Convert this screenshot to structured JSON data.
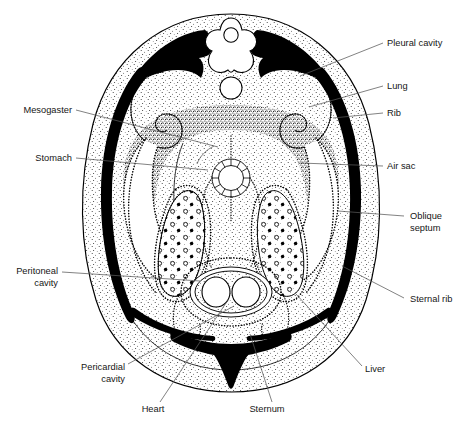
{
  "figure": {
    "view": "cross-section",
    "orientation": "dorsal at top, ventral at bottom"
  },
  "labels": {
    "left": [
      {
        "id": "mesogaster",
        "text": "Mesogaster",
        "x": 72,
        "y": 113,
        "lines": 1,
        "leader": [
          [
            76,
            110
          ],
          [
            218,
            147
          ]
        ]
      },
      {
        "id": "stomach",
        "text": "Stomach",
        "x": 72,
        "y": 161,
        "lines": 1,
        "leader": [
          [
            76,
            158
          ],
          [
            206,
            168
          ]
        ]
      },
      {
        "id": "peritoneal-cavity",
        "text": "Peritoneal\ncavity",
        "line1": "Peritoneal",
        "line2": "cavity",
        "x": 58,
        "y": 274,
        "lines": 2,
        "leader": [
          [
            62,
            272
          ],
          [
            196,
            281
          ]
        ]
      },
      {
        "id": "pericardial-cavity",
        "text": "Pericardial\ncavity",
        "line1": "Pericardial",
        "line2": "cavity",
        "x": 125,
        "y": 370,
        "lines": 2,
        "leader": [
          [
            128,
            364
          ],
          [
            231,
            317
          ]
        ]
      }
    ],
    "right": [
      {
        "id": "pleural-cavity",
        "text": "Pleural cavity",
        "x": 387,
        "y": 43,
        "lines": 1,
        "leader": [
          [
            383,
            43
          ],
          [
            300,
            75
          ]
        ]
      },
      {
        "id": "lung",
        "text": "Lung",
        "x": 387,
        "y": 86,
        "lines": 1,
        "leader": [
          [
            383,
            86
          ],
          [
            310,
            105
          ]
        ]
      },
      {
        "id": "rib",
        "text": "Rib",
        "x": 387,
        "y": 113,
        "lines": 1,
        "leader": [
          [
            383,
            113
          ],
          [
            330,
            117
          ]
        ]
      },
      {
        "id": "air-sac",
        "text": "Air sac",
        "x": 387,
        "y": 166,
        "lines": 1,
        "leader": [
          [
            383,
            166
          ],
          [
            303,
            163
          ]
        ]
      },
      {
        "id": "oblique-septum",
        "text": "Oblique\nseptum",
        "line1": "Oblique",
        "line2": "septum",
        "x": 408,
        "y": 218,
        "lines": 2,
        "leader": [
          [
            404,
            216
          ],
          [
            338,
            211
          ]
        ]
      },
      {
        "id": "sternal-rib",
        "text": "Sternal rib",
        "x": 408,
        "y": 301,
        "lines": 1,
        "leader": [
          [
            404,
            298
          ],
          [
            342,
            266
          ]
        ]
      },
      {
        "id": "liver",
        "text": "Liver",
        "x": 365,
        "y": 371,
        "lines": 1,
        "leader": [
          [
            362,
            366
          ],
          [
            298,
            296
          ]
        ]
      }
    ],
    "bottom": [
      {
        "id": "heart",
        "text": "Heart",
        "x": 153,
        "y": 409,
        "lines": 1,
        "leader": [
          [
            160,
            402
          ],
          [
            228,
            301
          ]
        ]
      },
      {
        "id": "sternum",
        "text": "Sternum",
        "x": 263,
        "y": 409,
        "lines": 1,
        "leader": [
          [
            272,
            402
          ],
          [
            248,
            334
          ]
        ]
      }
    ]
  },
  "structures": [
    {
      "id": "body-wall",
      "name": "Body wall",
      "fill": "stipple-light"
    },
    {
      "id": "vertebra",
      "name": "Vertebra",
      "fill": "white"
    },
    {
      "id": "spinal-cord",
      "name": "Spinal cord",
      "fill": "white"
    },
    {
      "id": "aorta",
      "name": "Dorsal aorta",
      "fill": "white"
    },
    {
      "id": "rib",
      "name": "Rib",
      "fill": "solid-black"
    },
    {
      "id": "sternal-rib",
      "name": "Sternal rib",
      "fill": "solid-black"
    },
    {
      "id": "sternum",
      "name": "Sternum",
      "fill": "solid-black"
    },
    {
      "id": "lung-left",
      "name": "Lung (left)",
      "fill": "stipple-dark"
    },
    {
      "id": "lung-right",
      "name": "Lung (right)",
      "fill": "stipple-dark"
    },
    {
      "id": "pleural-cavity",
      "name": "Pleural cavity",
      "fill": "white"
    },
    {
      "id": "air-sac-left",
      "name": "Air sac (left)",
      "fill": "white"
    },
    {
      "id": "air-sac-right",
      "name": "Air sac (right)",
      "fill": "white"
    },
    {
      "id": "oblique-septum",
      "name": "Oblique septum",
      "fill": "dotted-line"
    },
    {
      "id": "trachea",
      "name": "Bronchus / trachea",
      "fill": "cartilage-ring"
    },
    {
      "id": "liver-left",
      "name": "Liver (left lobe)",
      "fill": "stipple-vesicles"
    },
    {
      "id": "liver-right",
      "name": "Liver (right lobe)",
      "fill": "stipple-vesicles"
    },
    {
      "id": "heart",
      "name": "Heart",
      "fill": "stipple-light"
    },
    {
      "id": "heart-chamber-l",
      "name": "Heart chamber (left)",
      "fill": "white"
    },
    {
      "id": "heart-chamber-r",
      "name": "Heart chamber (right)",
      "fill": "white"
    },
    {
      "id": "pericardial-cavity",
      "name": "Pericardial cavity",
      "fill": "white"
    },
    {
      "id": "peritoneal-cavity",
      "name": "Peritoneal cavity",
      "fill": "white"
    },
    {
      "id": "stomach",
      "name": "Stomach",
      "fill": "white"
    },
    {
      "id": "mesogaster",
      "name": "Mesogaster",
      "fill": "stipple-dark"
    }
  ],
  "colors": {
    "ink": "#000000",
    "leader": "#585858",
    "text": "#161616",
    "page": "#ffffff"
  }
}
